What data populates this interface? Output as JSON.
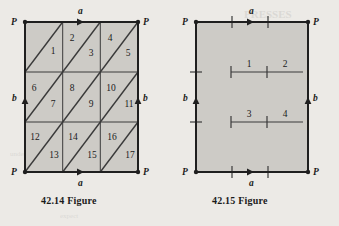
{
  "page": {
    "background_color": "#eceae6",
    "fill_color": "#cdcbc6",
    "line_color": "#2b2b2b"
  },
  "figures": [
    {
      "id": "figure-42-14",
      "caption": "42.14 Figure",
      "type": "triangulated-square-identification-diagram",
      "corner_labels": {
        "top_left": "P",
        "top_right": "P",
        "bottom_left": "P",
        "bottom_right": "P"
      },
      "edge_labels": {
        "top": "a",
        "bottom": "a",
        "left": "b",
        "right": "b"
      },
      "edge_arrow_directions": {
        "top": "right",
        "bottom": "right",
        "left": "up",
        "right": "up"
      },
      "grid": {
        "columns": 3,
        "rows": 3
      },
      "triangle_labels": [
        "1",
        "2",
        "3",
        "4",
        "5",
        "6",
        "7",
        "8",
        "9",
        "10",
        "11",
        "12",
        "13",
        "14",
        "15",
        "16",
        "17"
      ],
      "triangle_count_visible_labels": 17,
      "diagonal_direction": "lower-left-to-upper-right"
    },
    {
      "id": "figure-42-15",
      "caption": "42.15 Figure",
      "type": "square-identification-diagram",
      "corner_labels": {
        "top_left": "P",
        "top_right": "P",
        "bottom_left": "P",
        "bottom_right": "P"
      },
      "edge_labels": {
        "top": "a",
        "bottom": "a",
        "left": "b",
        "right": "b"
      },
      "edge_arrow_directions": {
        "top": "right",
        "bottom": "right",
        "left": "up",
        "right": "up"
      },
      "segment_labels": [
        "1",
        "2",
        "3",
        "4"
      ],
      "internal_segments": 2,
      "tick_marks_per_edge": 2
    }
  ]
}
